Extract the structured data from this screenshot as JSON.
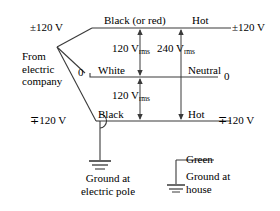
{
  "diagram": {
    "colors": {
      "wire": "#3a3a3a",
      "text": "#000000",
      "background": "#ffffff"
    },
    "source": {
      "line1": "From",
      "line2": "electric",
      "line3": "company"
    },
    "terminals": {
      "top_left_voltage": "±120 V",
      "mid_left_zero": "0",
      "bottom_left_voltage": "∓120 V",
      "top_right_voltage": "±120 V",
      "mid_right_zero": "0",
      "bottom_right_voltage": "∓120 V"
    },
    "conductors": {
      "top_wire_label": "Black (or red)",
      "mid_wire_label": "White",
      "bottom_wire_label": "Black",
      "ground_wire_label": "Green"
    },
    "service_labels": {
      "top_hot": "Hot",
      "neutral": "Neutral",
      "bottom_hot": "Hot"
    },
    "measurements": [
      {
        "name": "upper-120",
        "value": "120 V",
        "unit": "rms"
      },
      {
        "name": "lower-120",
        "value": "120 V",
        "unit": "rms"
      },
      {
        "name": "full-240",
        "value": "240 V",
        "unit": "rms"
      }
    ],
    "grounds": {
      "pole": {
        "line1": "Ground at",
        "line2": "electric pole"
      },
      "house": {
        "line1": "Ground at",
        "line2": "house"
      }
    }
  }
}
